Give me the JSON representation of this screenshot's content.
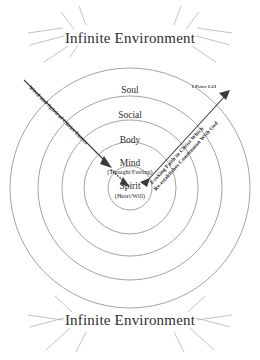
{
  "diagram": {
    "title_top": "Infinite Environment",
    "title_bottom": "Infinite Environment",
    "scripture_ref": "1 Peter 1:21",
    "rings": [
      {
        "label": "Soul",
        "sublabel": ""
      },
      {
        "label": "Social",
        "sublabel": ""
      },
      {
        "label": "Body",
        "sublabel": ""
      },
      {
        "label": "Mind",
        "sublabel": "(Thought/Feeling)"
      },
      {
        "label": "Spirit",
        "sublabel": "(Heart/Will)"
      }
    ],
    "arrow_in_label": "Word and Spirit of Christ Enters",
    "arrow_out_label_line1": "Evoking  Faith  in  Christ  Which",
    "arrow_out_label_line2": "Re-establishes Communion With God",
    "colors": {
      "ring_stroke": "#8d8d8d",
      "ray_stroke": "#b4b4b4",
      "arrow_stroke": "#3a3a3a",
      "text": "#2e2e2e",
      "background": "#ffffff"
    }
  }
}
